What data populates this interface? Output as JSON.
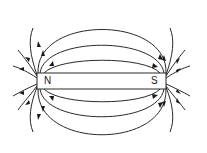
{
  "diagram": {
    "magnet": {
      "north_label": "N",
      "south_label": "S"
    },
    "colors": {
      "line": "#2a2a2a",
      "background": "#ffffff"
    },
    "field_direction": "N-to-S (outside magnet)"
  }
}
